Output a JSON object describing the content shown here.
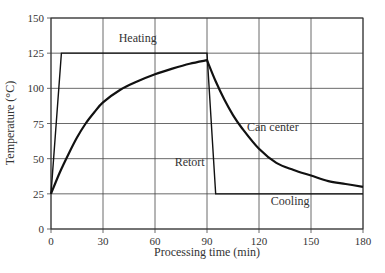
{
  "chart_data": {
    "type": "line",
    "title": "",
    "xlabel": "Processing time (min)",
    "ylabel": "Temperature (°C)",
    "xlim": [
      0,
      180
    ],
    "ylim": [
      0,
      150
    ],
    "xticks": [
      0,
      30,
      60,
      90,
      120,
      150,
      180
    ],
    "yticks": [
      0,
      25,
      50,
      75,
      100,
      125,
      150
    ],
    "grid": true,
    "legend": "none (inline annotations)",
    "series": [
      {
        "name": "Retort",
        "x": [
          0,
          6,
          90,
          95,
          180
        ],
        "y": [
          25,
          125,
          125,
          25,
          25
        ]
      },
      {
        "name": "Can center",
        "x": [
          0,
          5,
          10,
          15,
          20,
          25,
          30,
          40,
          50,
          60,
          70,
          80,
          90,
          95,
          100,
          105,
          110,
          120,
          130,
          140,
          150,
          160,
          170,
          180
        ],
        "y": [
          25,
          40,
          53,
          65,
          75,
          83,
          90,
          99,
          105,
          110,
          114,
          117.5,
          120,
          105,
          92,
          81,
          72,
          57,
          47,
          42,
          38,
          34,
          32,
          30
        ]
      }
    ],
    "annotations": [
      {
        "text": "Heating",
        "x": 50,
        "y": 133
      },
      {
        "text": "Retort",
        "x": 80,
        "y": 45
      },
      {
        "text": "Can center",
        "x": 128,
        "y": 70
      },
      {
        "text": "Cooling",
        "x": 138,
        "y": 17
      }
    ]
  }
}
